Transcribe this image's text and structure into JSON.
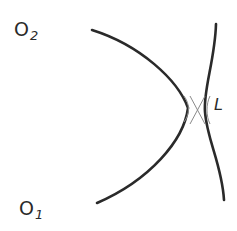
{
  "diagram": {
    "labels": {
      "o2": {
        "main": "O",
        "sub": "2"
      },
      "o1": {
        "main": "O",
        "sub": "1"
      },
      "l": "L"
    },
    "colors": {
      "stroke": "#2a2a2a",
      "thin_stroke": "#8a8a8a",
      "background": "#ffffff"
    },
    "elements": [
      {
        "id": "left-arc",
        "description": "arc curving from upper-left to lower-left, bulging right toward L"
      },
      {
        "id": "right-arc",
        "description": "arc curving from top-right to bottom-right, bulging left toward L"
      },
      {
        "id": "crossing-lines",
        "description": "thin X-shaped crossing between the two arcs at the narrowest gap"
      }
    ]
  }
}
